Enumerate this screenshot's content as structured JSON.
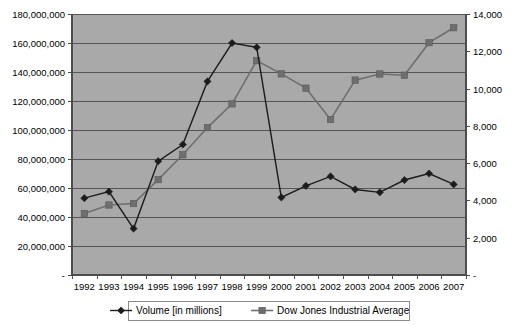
{
  "chart_data": {
    "type": "line",
    "title": "",
    "subtitle": "",
    "xlabel": "",
    "ylabel": "",
    "grid": true,
    "legend_position": "bottom",
    "categories": [
      "1992",
      "1993",
      "1994",
      "1995",
      "1996",
      "1997",
      "1998",
      "1999",
      "2000",
      "2001",
      "2002",
      "2003",
      "2004",
      "2005",
      "2006",
      "2007"
    ],
    "series": [
      {
        "name": "Volume [in millions]",
        "axis": "left",
        "marker": "diamond",
        "color": "#1c1c1c",
        "values": [
          53000000,
          57500000,
          32000000,
          78500000,
          90000000,
          133500000,
          160000000,
          157000000,
          53500000,
          61500000,
          68000000,
          59000000,
          57000000,
          65500000,
          70000000,
          62500000
        ]
      },
      {
        "name": "Dow Jones Industrial Average",
        "axis": "right",
        "marker": "square",
        "color": "#6e6e6e",
        "values": [
          3301,
          3754,
          3834,
          5117,
          6448,
          7908,
          9181,
          11497,
          10787,
          10022,
          8342,
          10454,
          10783,
          10718,
          12463,
          13265
        ]
      }
    ],
    "left_axis": {
      "min": 0,
      "max": 180000000,
      "step": 20000000,
      "tick_labels": [
        "180,000,000",
        "160,000,000",
        "140,000,000",
        "120,000,000",
        "100,000,000",
        "80,000,000",
        "60,000,000",
        "40,000,000",
        "20,000,000",
        "-"
      ]
    },
    "right_axis": {
      "min": 0,
      "max": 14000,
      "step": 2000,
      "tick_labels": [
        "14,000",
        "12,000",
        "10,000",
        "8,000",
        "6,000",
        "4,000",
        "2,000",
        "-"
      ]
    },
    "plot_background_color": "#a9a9a9",
    "page_background_color": "#ffffff"
  },
  "legend": {
    "items": [
      {
        "label": "Volume [in millions]",
        "marker": "diamond-marker-icon"
      },
      {
        "label": "Dow Jones Industrial Average",
        "marker": "square-marker-icon"
      }
    ]
  }
}
